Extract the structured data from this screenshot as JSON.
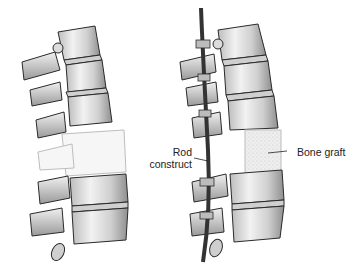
{
  "figure": {
    "panels": [
      {
        "id": "before",
        "description": "Lateral view of spine with collapsed/damaged vertebra (shown faded)"
      },
      {
        "id": "after",
        "description": "Lateral view of spine after fusion with rod construct and bone graft"
      }
    ],
    "labels": {
      "rod_line1": "Rod",
      "rod_line2": "construct",
      "bone_graft": "Bone graft"
    },
    "colors": {
      "bone_fill": "#e6e6e6",
      "bone_shade": "#a8a8a8",
      "outline": "#2a2a2a",
      "faded": "#d0d0d0",
      "rod": "#333333",
      "graft": "#ececec"
    }
  }
}
